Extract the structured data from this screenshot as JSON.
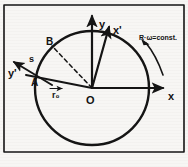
{
  "figure": {
    "type": "physics-vector-diagram",
    "frame": {
      "border_color": "#141414",
      "background": "#f7f6f4",
      "x": 4,
      "y": 5,
      "width": 180,
      "height": 147
    },
    "circle": {
      "label": "trajectory-circle",
      "center_x": 92,
      "center_y": 88,
      "radius": 57,
      "color": "#141414"
    },
    "origin": {
      "label": "O",
      "x": 92,
      "y": 88
    },
    "axes": [
      {
        "name": "y-axis",
        "label": "y",
        "label_x": 99,
        "label_y": 24,
        "from_x": 92,
        "from_y": 88,
        "to_x": 92,
        "to_y": 14,
        "arrow": true
      },
      {
        "name": "x-axis",
        "label": "x",
        "label_x": 170,
        "label_y": 98,
        "from_x": 92,
        "from_y": 88,
        "to_x": 165,
        "to_y": 88,
        "arrow": true
      },
      {
        "name": "x-prime-axis",
        "label": "x'",
        "label_x": 114,
        "label_y": 33,
        "from_x": 92,
        "from_y": 88,
        "to_x": 108,
        "to_y": 26,
        "arrow": true
      },
      {
        "name": "y-prime-axis",
        "label": "y'",
        "label_x": 10,
        "label_y": 74,
        "from_x": 50,
        "from_y": 84,
        "to_x": 14,
        "to_y": 63,
        "arrow": true
      }
    ],
    "points": [
      {
        "name": "point-a",
        "label": "A",
        "x": 37,
        "y": 78,
        "label_x": 31,
        "label_y": 85
      },
      {
        "name": "point-b",
        "label": "B",
        "x": 52,
        "y": 46,
        "label_x": 46,
        "label_y": 44
      }
    ],
    "arc_label": {
      "name": "arc-length-s",
      "label": "s",
      "label_x": 31,
      "label_y": 60
    },
    "radius_vector": {
      "name": "position-vector",
      "label": "r₀",
      "label_x": 53,
      "label_y": 95,
      "from_x": 92,
      "from_y": 88,
      "to_x": 37,
      "to_y": 78
    },
    "dashed_radius": {
      "name": "dashed-radius-to-b",
      "from_x": 92,
      "from_y": 88,
      "to_x": 52,
      "to_y": 46
    },
    "annotation": {
      "name": "omega-constant-note",
      "text": "R·ω=const.",
      "text_x": 139,
      "text_y": 38,
      "pointer_from_x": 145,
      "pointer_from_y": 42,
      "pointer_to_x": 164,
      "pointer_to_y": 72
    }
  }
}
